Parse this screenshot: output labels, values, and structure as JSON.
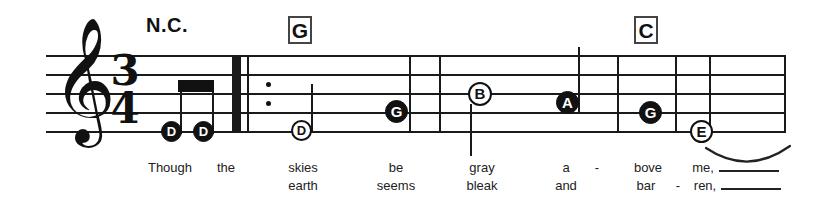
{
  "score": {
    "clef_glyph": "𝄞",
    "time_signature": {
      "numerator": "3",
      "denominator": "4"
    },
    "chords": [
      {
        "label": "N.C.",
        "boxed": false,
        "x": 146,
        "y": 14
      },
      {
        "label": "G",
        "boxed": true,
        "x": 288,
        "y": 16
      },
      {
        "label": "C",
        "boxed": true,
        "x": 634,
        "y": 16
      }
    ],
    "notes": [
      {
        "letter": "D",
        "style": "filled",
        "x": 171,
        "y": 131,
        "size": 20
      },
      {
        "letter": "D",
        "style": "filled",
        "x": 203,
        "y": 131,
        "size": 20
      },
      {
        "letter": "D",
        "style": "hollow",
        "x": 301,
        "y": 130,
        "size": 20
      },
      {
        "letter": "G",
        "style": "filled",
        "x": 396,
        "y": 111,
        "size": 22
      },
      {
        "letter": "B",
        "style": "hollow",
        "x": 480,
        "y": 93,
        "size": 23
      },
      {
        "letter": "A",
        "style": "filled",
        "x": 567,
        "y": 102,
        "size": 22
      },
      {
        "letter": "G",
        "style": "filled",
        "x": 650,
        "y": 112,
        "size": 22
      },
      {
        "letter": "E",
        "style": "hollow",
        "x": 701,
        "y": 131,
        "size": 22
      }
    ],
    "lyrics_line_1": [
      {
        "text": "Though",
        "x": 170
      },
      {
        "text": "the",
        "x": 226
      },
      {
        "text": "skies",
        "x": 303
      },
      {
        "text": "be",
        "x": 396
      },
      {
        "text": "gray",
        "x": 482
      },
      {
        "text": "a",
        "x": 566
      },
      {
        "text": "-",
        "x": 597
      },
      {
        "text": "bove",
        "x": 648
      },
      {
        "text": "me,",
        "x": 703
      }
    ],
    "lyrics_line_2": [
      {
        "text": "earth",
        "x": 303
      },
      {
        "text": "seems",
        "x": 396
      },
      {
        "text": "bleak",
        "x": 482
      },
      {
        "text": "and",
        "x": 566
      },
      {
        "text": "bar",
        "x": 646
      },
      {
        "text": "-",
        "x": 678
      },
      {
        "text": "ren,",
        "x": 705
      }
    ],
    "lyric_extensions": [
      {
        "x": 719,
        "y": 170,
        "width": 60
      },
      {
        "x": 721,
        "y": 188,
        "width": 60
      }
    ],
    "staff": {
      "left": 46,
      "right": 786,
      "line_ys": [
        55,
        74,
        93,
        112,
        131
      ]
    },
    "barlines": [
      {
        "x": 409,
        "type": "single"
      },
      {
        "x": 439,
        "type": "single"
      },
      {
        "x": 617,
        "type": "single"
      },
      {
        "x": 675,
        "type": "single"
      },
      {
        "x": 709,
        "type": "single"
      },
      {
        "x": 786,
        "type": "single"
      }
    ],
    "repeat": {
      "thick_x": 232,
      "thin_x": 247,
      "dot_x": 266,
      "dot_ys": [
        85,
        104
      ]
    },
    "colors": {
      "ink": "#111111",
      "staff": "#1a1a1a",
      "box_border": "#444444"
    }
  }
}
